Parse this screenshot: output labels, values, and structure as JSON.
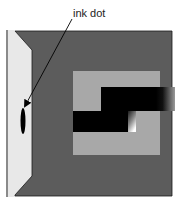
{
  "diagram": {
    "type": "schematic illustration",
    "annotation": {
      "label": "ink dot",
      "arrow_from": [
        72,
        19
      ],
      "arrow_to": [
        24,
        108
      ]
    },
    "colors": {
      "background": "#ffffff",
      "outer_square": "#5c5c5c",
      "inner_square": "#a8a8a8",
      "left_panel": "#e8e8e8",
      "left_edge_line": "#8a8a8a",
      "black_bar": "#000000",
      "ink_dot": "#000000",
      "outline": "#1a1a1a"
    },
    "elements": [
      {
        "name": "left-panel",
        "description": "light trapezoid panel on the left side"
      },
      {
        "name": "outer-dark-square",
        "bbox": [
          15,
          31,
          172,
          196
        ]
      },
      {
        "name": "inner-light-square",
        "bbox": [
          73,
          71,
          160,
          155
        ]
      },
      {
        "name": "upper-black-bar",
        "bbox": [
          101,
          87,
          175,
          111
        ],
        "gradient_fade_right": true
      },
      {
        "name": "lower-black-bar",
        "bbox": [
          73,
          111,
          128,
          132
        ]
      },
      {
        "name": "gradient-notch",
        "bbox": [
          128,
          111,
          136,
          132
        ]
      },
      {
        "name": "ink-dot",
        "center": [
          23,
          121
        ],
        "rx": 2.5,
        "ry": 13
      }
    ]
  }
}
